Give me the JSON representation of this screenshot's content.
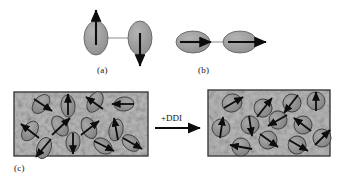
{
  "figure": {
    "caption_labels": {
      "a": "(a)",
      "b": "(b)",
      "c": "(c)"
    },
    "process_arrow_label": "+DDI",
    "colors": {
      "particle_fill": "#9a9a9a",
      "particle_stroke": "#4a4a4a",
      "arrow": "#0d0d0d",
      "panel_border": "#3c3c3c",
      "panel_background": "#b0b0b0",
      "page_background": "#ffffff",
      "text": "#141414"
    }
  },
  "panel_a": {
    "label": "(a)",
    "description": "two vertically elongated particles joined by a horizontal link with antiparallel moments",
    "link": {
      "x1": 96,
      "y1": 38,
      "x2": 140,
      "y2": 38
    },
    "particles": [
      {
        "cx": 96,
        "cy": 38,
        "rx": 12,
        "ry": 17,
        "rot": 0,
        "arrow_angle": 90,
        "arrow_length": 32,
        "arrow_dir": "up"
      },
      {
        "cx": 140,
        "cy": 38,
        "rx": 12,
        "ry": 17,
        "rot": 0,
        "arrow_angle": -90,
        "arrow_length": 32,
        "arrow_dir": "down"
      }
    ]
  },
  "panel_b": {
    "label": "(b)",
    "description": "two horizontally elongated particles joined in a chain with parallel moments pointing right",
    "link": {
      "x1": 193,
      "y1": 42,
      "x2": 232,
      "y2": 42
    },
    "particles": [
      {
        "cx": 193,
        "cy": 42,
        "rx": 17,
        "ry": 11,
        "rot": 0,
        "arrow_angle": 0,
        "arrow_length": 30,
        "arrow_dir": "right"
      },
      {
        "cx": 240,
        "cy": 42,
        "rx": 17,
        "ry": 11,
        "rot": 0,
        "arrow_angle": 0,
        "arrow_length": 38,
        "arrow_dir": "right"
      }
    ]
  },
  "panel_c": {
    "label": "(c)",
    "left_box": {
      "x": 14,
      "y": 92,
      "w": 134,
      "h": 64
    },
    "right_box": {
      "x": 208,
      "y": 90,
      "w": 122,
      "h": 66
    },
    "process_arrow": {
      "x1": 155,
      "y1": 128,
      "x2": 202,
      "y2": 128,
      "label": "+DDI"
    },
    "left_particles": [
      {
        "cx": 41,
        "cy": 104,
        "rx": 7,
        "ry": 11,
        "rot": 40,
        "arrow_angle": -40
      },
      {
        "cx": 68,
        "cy": 106,
        "rx": 7,
        "ry": 11,
        "rot": -5,
        "arrow_angle": 88
      },
      {
        "cx": 95,
        "cy": 102,
        "rx": 7,
        "ry": 11,
        "rot": 30,
        "arrow_angle": 130
      },
      {
        "cx": 124,
        "cy": 104,
        "rx": 8,
        "ry": 10,
        "rot": 85,
        "arrow_angle": 180
      },
      {
        "cx": 30,
        "cy": 131,
        "rx": 7,
        "ry": 11,
        "rot": 35,
        "arrow_angle": 140
      },
      {
        "cx": 60,
        "cy": 126,
        "rx": 7,
        "ry": 11,
        "rot": -30,
        "arrow_angle": 45
      },
      {
        "cx": 89,
        "cy": 128,
        "rx": 7,
        "ry": 11,
        "rot": -25,
        "arrow_angle": 55
      },
      {
        "cx": 116,
        "cy": 130,
        "rx": 7,
        "ry": 11,
        "rot": 12,
        "arrow_angle": 100
      },
      {
        "cx": 44,
        "cy": 148,
        "rx": 7,
        "ry": 11,
        "rot": 20,
        "arrow_angle": -130
      },
      {
        "cx": 73,
        "cy": 142,
        "rx": 7,
        "ry": 10,
        "rot": 5,
        "arrow_angle": -92
      },
      {
        "cx": 103,
        "cy": 146,
        "rx": 8,
        "ry": 10,
        "rot": -55,
        "arrow_angle": -35
      },
      {
        "cx": 131,
        "cy": 143,
        "rx": 8,
        "ry": 10,
        "rot": -50,
        "arrow_angle": -28
      }
    ],
    "right_particles": [
      {
        "cx": 232,
        "cy": 103,
        "rx": 10,
        "ry": 9,
        "rot": -20,
        "arrow_angle": 30
      },
      {
        "cx": 263,
        "cy": 108,
        "rx": 9,
        "ry": 9,
        "rot": -25,
        "arrow_angle": 55
      },
      {
        "cx": 292,
        "cy": 103,
        "rx": 9,
        "ry": 9,
        "rot": -20,
        "arrow_angle": -60
      },
      {
        "cx": 316,
        "cy": 101,
        "rx": 9,
        "ry": 9,
        "rot": 0,
        "arrow_angle": 82
      },
      {
        "cx": 221,
        "cy": 128,
        "rx": 9,
        "ry": 9,
        "rot": 10,
        "arrow_angle": 80
      },
      {
        "cx": 250,
        "cy": 125,
        "rx": 9,
        "ry": 9,
        "rot": -10,
        "arrow_angle": -80
      },
      {
        "cx": 278,
        "cy": 120,
        "rx": 9,
        "ry": 9,
        "rot": -30,
        "arrow_angle": -150
      },
      {
        "cx": 303,
        "cy": 125,
        "rx": 9,
        "ry": 9,
        "rot": -15,
        "arrow_angle": 130
      },
      {
        "cx": 241,
        "cy": 147,
        "rx": 9,
        "ry": 9,
        "rot": 15,
        "arrow_angle": -170
      },
      {
        "cx": 268,
        "cy": 140,
        "rx": 9,
        "ry": 9,
        "rot": -20,
        "arrow_angle": -25
      },
      {
        "cx": 297,
        "cy": 145,
        "rx": 9,
        "ry": 9,
        "rot": -25,
        "arrow_angle": -30
      },
      {
        "cx": 322,
        "cy": 138,
        "rx": 9,
        "ry": 9,
        "rot": -20,
        "arrow_angle": 60
      }
    ]
  }
}
